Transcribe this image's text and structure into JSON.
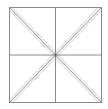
{
  "diagram": {
    "type": "square-with-diagonals",
    "frame": {
      "x1": 9.5,
      "y1": 7.5,
      "x2": 101.5,
      "y2": 102.5
    },
    "center": {
      "x": 55.5,
      "y": 55
    },
    "colors": {
      "main_line": "#8a8a8a",
      "offset_line": "#d0d0d0",
      "center_dot": "#555555"
    },
    "offset": 3
  }
}
